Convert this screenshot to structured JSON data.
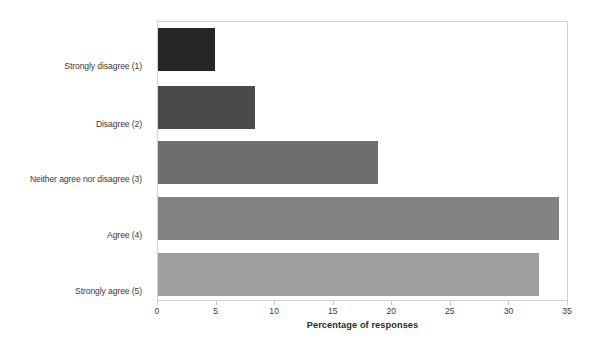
{
  "chart_data": {
    "type": "bar",
    "orientation": "horizontal",
    "title": "",
    "xlabel": "Percentage of responses",
    "ylabel": "",
    "categories": [
      "Strongly disagree (1)",
      "Disagree (2)",
      "Neither agree nor disagree (3)",
      "Agree (4)",
      "Strongly agree (5)"
    ],
    "values": [
      4.9,
      8.3,
      18.8,
      34.2,
      32.5
    ],
    "xlim": [
      0,
      35
    ],
    "xticks": [
      0,
      5,
      10,
      15,
      20,
      25,
      30,
      35
    ],
    "xtick_labels": [
      "0",
      "5",
      "10",
      "15",
      "20",
      "25",
      "30",
      "35"
    ],
    "grid": false,
    "legend": false,
    "bar_colors": [
      "#262626",
      "#4a4a4a",
      "#6e6e6e",
      "#828282",
      "#9e9e9e"
    ]
  },
  "axis": {
    "x_title": "Percentage of responses"
  },
  "frame": {
    "border_color": "#d3d3d3",
    "background": "#ffffff"
  }
}
